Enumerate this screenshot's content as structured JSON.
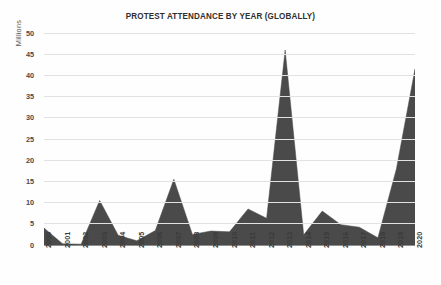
{
  "chart_data": {
    "type": "area",
    "title": "PROTEST ATTENDANCE BY YEAR (GLOBALLY)",
    "xlabel": "",
    "ylabel": "Millions",
    "ylim": [
      0,
      50
    ],
    "ytick_step": 5,
    "grid": true,
    "legend": "none",
    "series_color": "#4a4a4a",
    "categories": [
      "2000",
      "2001",
      "2002",
      "2003",
      "2004",
      "2005",
      "2006",
      "2007",
      "2008",
      "2009",
      "2010",
      "2011",
      "2012",
      "2013",
      "2014",
      "2015",
      "2016",
      "2017",
      "2018",
      "2019",
      "2020"
    ],
    "values": [
      4.0,
      0.3,
      0.2,
      10.5,
      2.3,
      1.0,
      3.4,
      15.5,
      2.5,
      3.3,
      3.1,
      8.5,
      6.3,
      46.0,
      2.4,
      8.0,
      4.8,
      4.2,
      1.7,
      18.0,
      41.5
    ],
    "ytick_labels": [
      "0",
      "5",
      "10",
      "15",
      "20",
      "25",
      "30",
      "35",
      "40",
      "45",
      "50"
    ]
  },
  "axis": {
    "y_title": "Millions"
  }
}
